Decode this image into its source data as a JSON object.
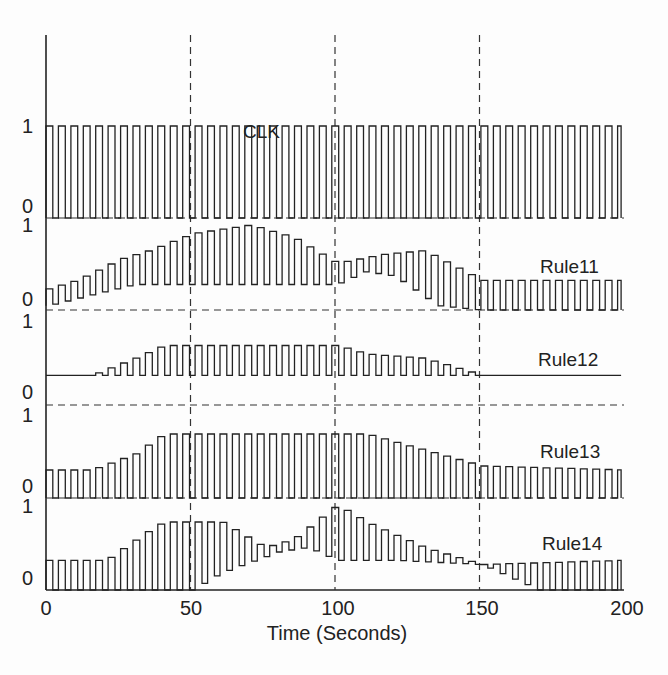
{
  "chart_data": {
    "type": "line",
    "title": "",
    "xlabel": "Time (Seconds)",
    "ylabel": "",
    "xlim": [
      0,
      200
    ],
    "x_ticks": [
      0,
      50,
      100,
      150,
      200
    ],
    "x_tick_labels": [
      "0",
      "50",
      "100",
      "150",
      "200"
    ],
    "vertical_reference_lines": [
      50,
      100,
      150
    ],
    "grid": false,
    "legend": "inline labels",
    "series": [
      {
        "name": "CLK",
        "label": "CLK",
        "ylim": [
          0,
          1
        ],
        "y_tick_labels": [
          "0",
          "1"
        ],
        "description": "square wave clock, period ~4 s, high 1 low 0",
        "envelope_peak": [
          [
            0,
            1
          ],
          [
            200,
            1
          ]
        ],
        "envelope_low": [
          [
            0,
            0
          ],
          [
            200,
            0
          ]
        ]
      },
      {
        "name": "Rule11",
        "label": "Rule11",
        "ylim": [
          0,
          1
        ],
        "y_tick_labels": [
          "0",
          "1"
        ],
        "description": "rises 0.2 to ~0.7 by 30s, oscillates 0.3-1.0 peaking near 60-80s, decays to ~0.35 oscillation after 150s",
        "envelope_peak": [
          [
            0,
            0.25
          ],
          [
            10,
            0.35
          ],
          [
            25,
            0.6
          ],
          [
            35,
            0.7
          ],
          [
            50,
            0.9
          ],
          [
            70,
            1.0
          ],
          [
            85,
            0.85
          ],
          [
            100,
            0.55
          ],
          [
            115,
            0.65
          ],
          [
            130,
            0.7
          ],
          [
            150,
            0.35
          ],
          [
            200,
            0.35
          ]
        ],
        "envelope_low": [
          [
            0,
            0.05
          ],
          [
            30,
            0.3
          ],
          [
            100,
            0.3
          ],
          [
            110,
            0.45
          ],
          [
            120,
            0.4
          ],
          [
            135,
            0.05
          ],
          [
            150,
            0.0
          ],
          [
            200,
            0.0
          ]
        ]
      },
      {
        "name": "Rule12",
        "label": "Rule12",
        "ylim": [
          0,
          1
        ],
        "y_tick_labels": [
          "0",
          "1"
        ],
        "description": "flat at 0.35 until ~15s, oscillates up to ~0.7 between 30-110s, decays to flat 0.35 after 150s",
        "envelope_peak": [
          [
            0,
            0.35
          ],
          [
            15,
            0.35
          ],
          [
            30,
            0.55
          ],
          [
            40,
            0.7
          ],
          [
            100,
            0.7
          ],
          [
            110,
            0.6
          ],
          [
            130,
            0.55
          ],
          [
            150,
            0.35
          ],
          [
            200,
            0.35
          ]
        ],
        "envelope_low": [
          [
            0,
            0.35
          ],
          [
            200,
            0.35
          ]
        ]
      },
      {
        "name": "Rule13",
        "label": "Rule13",
        "ylim": [
          0,
          1
        ],
        "y_tick_labels": [
          "0",
          "1"
        ],
        "description": "oscillates 0-0.35 early, envelope peaks ~0.8 near 40-110s, returns to 0-0.35 after 150s",
        "envelope_peak": [
          [
            0,
            0.35
          ],
          [
            15,
            0.35
          ],
          [
            30,
            0.55
          ],
          [
            40,
            0.8
          ],
          [
            110,
            0.8
          ],
          [
            135,
            0.55
          ],
          [
            150,
            0.4
          ],
          [
            200,
            0.35
          ]
        ],
        "envelope_low": [
          [
            0,
            0
          ],
          [
            200,
            0
          ]
        ]
      },
      {
        "name": "Rule14",
        "label": "Rule14",
        "ylim": [
          0,
          1
        ],
        "y_tick_labels": [
          "0",
          "1"
        ],
        "description": "oscillates 0-0.35 early, rises to ~0.8 by 40s, dips mid, peaks ~1.0 near 100s, decays below 0.35 after 150s then oscillates 0-0.35",
        "envelope_peak": [
          [
            0,
            0.35
          ],
          [
            20,
            0.35
          ],
          [
            35,
            0.7
          ],
          [
            40,
            0.8
          ],
          [
            60,
            0.8
          ],
          [
            75,
            0.5
          ],
          [
            85,
            0.6
          ],
          [
            100,
            1.0
          ],
          [
            110,
            0.8
          ],
          [
            130,
            0.5
          ],
          [
            150,
            0.3
          ],
          [
            200,
            0.35
          ]
        ],
        "envelope_low": [
          [
            0,
            0
          ],
          [
            50,
            0
          ],
          [
            60,
            0.2
          ],
          [
            80,
            0.45
          ],
          [
            90,
            0.5
          ],
          [
            100,
            0.35
          ],
          [
            120,
            0.35
          ],
          [
            150,
            0.3
          ],
          [
            170,
            0
          ],
          [
            200,
            0
          ]
        ]
      }
    ]
  }
}
